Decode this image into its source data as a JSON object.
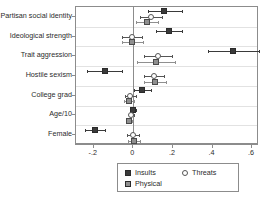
{
  "chart_data": {
    "type": "scatter",
    "subtype": "coefficient-plot-with-error-bars",
    "title": "",
    "xlabel": "",
    "ylabel": "",
    "xlim": [
      -0.29,
      0.635
    ],
    "xticks": [
      -0.2,
      0,
      0.2,
      0.4,
      0.6
    ],
    "xticklabels": [
      "-.2",
      "0",
      ".2",
      ".4",
      ".6"
    ],
    "grid": "horizontal-light",
    "zero_reference_line": 0,
    "legend_position": "bottom-center",
    "categories": [
      "Partisan social identity",
      "Ideological strength",
      "Trait aggression",
      "Hostile sexism",
      "College grad",
      "Age/10",
      "Female"
    ],
    "series": [
      {
        "name": "Insults",
        "marker": "filled-square",
        "color": "#3a3a3a",
        "values": [
          0.155,
          0.18,
          0.505,
          -0.145,
          0.045,
          0.0,
          -0.195
        ],
        "ci_low": [
          0.075,
          0.115,
          0.375,
          -0.235,
          0.005,
          -0.015,
          -0.245
        ],
        "ci_high": [
          0.245,
          0.245,
          0.635,
          -0.055,
          0.09,
          0.015,
          -0.145
        ]
      },
      {
        "name": "Threats",
        "marker": "hollow-circle",
        "color": "#555555",
        "values": [
          0.09,
          -0.005,
          0.125,
          0.105,
          -0.015,
          -0.01,
          0.0
        ],
        "ci_low": [
          0.035,
          -0.055,
          0.055,
          0.055,
          -0.04,
          -0.022,
          -0.03
        ],
        "ci_high": [
          0.145,
          0.045,
          0.195,
          0.155,
          0.012,
          0.002,
          0.03
        ]
      },
      {
        "name": "Physical",
        "marker": "filled-square-gray",
        "color": "#8f8f8f",
        "values": [
          0.07,
          -0.005,
          0.115,
          0.11,
          -0.02,
          -0.02,
          0.005
        ],
        "ci_low": [
          0.015,
          -0.06,
          0.02,
          0.055,
          -0.045,
          -0.032,
          -0.025
        ],
        "ci_high": [
          0.125,
          0.05,
          0.21,
          0.165,
          0.005,
          -0.008,
          0.035
        ]
      }
    ],
    "legend": [
      {
        "label": "Insults",
        "marker": "filled-square",
        "color": "#3a3a3a"
      },
      {
        "label": "Threats",
        "marker": "hollow-circle",
        "color": "#555555"
      },
      {
        "label": "Physical",
        "marker": "filled-square-gray",
        "color": "#8f8f8f"
      }
    ]
  }
}
